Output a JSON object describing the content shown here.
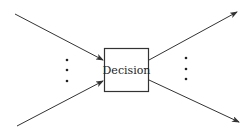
{
  "diagram": {
    "node": {
      "label": "Decision"
    },
    "inputs": [
      {
        "from": [
          15,
          14
        ],
        "to": [
          103,
          60
        ]
      },
      {
        "from": [
          17,
          126
        ],
        "to": [
          103,
          81
        ]
      }
    ],
    "outputs": [
      {
        "from": [
          149,
          60
        ],
        "to": [
          237,
          12
        ]
      },
      {
        "from": [
          149,
          80
        ],
        "to": [
          239,
          122
        ]
      }
    ],
    "ellipsis_left": {
      "x": 67,
      "y": [
        61,
        70,
        81
      ]
    },
    "ellipsis_right": {
      "x": 186,
      "y": [
        58,
        69,
        79
      ]
    },
    "colors": {
      "stroke": "#333333",
      "background": "#ffffff"
    }
  }
}
